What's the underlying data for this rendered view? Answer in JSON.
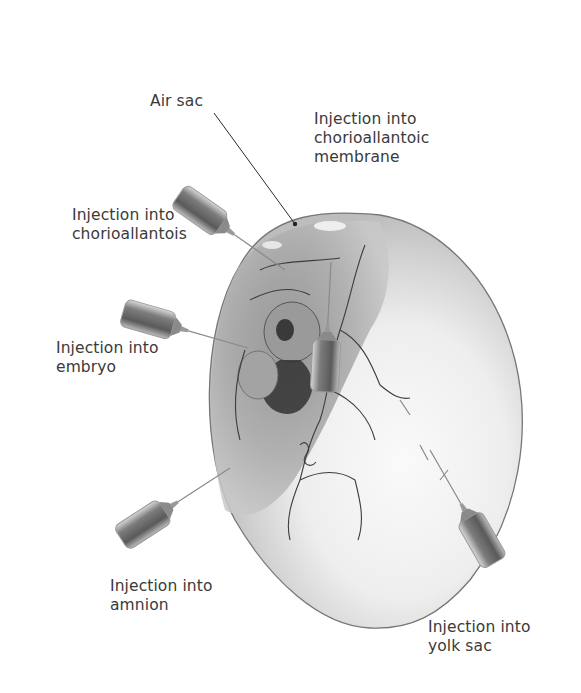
{
  "diagram": {
    "colors": {
      "background": "#ffffff",
      "text": "#3a3a3a",
      "leader_line": "#2a2a2a",
      "egg_shell_outline": "#777777",
      "syringe_body": "#6a6a6a",
      "vessels": "#3c3c3c"
    },
    "labels": [
      {
        "id": "air-sac",
        "text": "Air sac"
      },
      {
        "id": "cam",
        "text": "Injection into\nchorioallantoic\nmembrane"
      },
      {
        "id": "chorioallantois",
        "text": "Injection into\nchorioallantois"
      },
      {
        "id": "embryo",
        "text": "Injection into\nembryo"
      },
      {
        "id": "amnion",
        "text": "Injection into\namnion"
      },
      {
        "id": "yolk-sac",
        "text": "Injection into\nyolk sac"
      }
    ]
  }
}
